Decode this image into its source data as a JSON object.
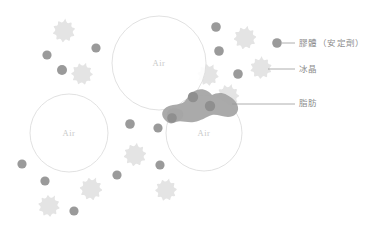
{
  "diagram": {
    "background": "#ffffff",
    "air_cells": [
      {
        "label": "Air",
        "cx": 159,
        "cy": 63,
        "r": 47
      },
      {
        "label": "Air",
        "cx": 69,
        "cy": 133,
        "r": 39
      },
      {
        "label": "Air",
        "cx": 204,
        "cy": 133,
        "r": 38
      }
    ],
    "air_cell_stroke": "#dedede",
    "air_label_color": "#c9c9c9",
    "colloid": {
      "name": "colloid-particle",
      "color": "#9a9a9a",
      "points": [
        {
          "cx": 62,
          "cy": 70,
          "r": 5.0
        },
        {
          "cx": 47,
          "cy": 55,
          "r": 4.6
        },
        {
          "cx": 96,
          "cy": 48,
          "r": 4.6
        },
        {
          "cx": 216,
          "cy": 27,
          "r": 4.8
        },
        {
          "cx": 219,
          "cy": 51,
          "r": 4.8
        },
        {
          "cx": 238,
          "cy": 74,
          "r": 4.8
        },
        {
          "cx": 130,
          "cy": 124,
          "r": 4.8
        },
        {
          "cx": 158,
          "cy": 128,
          "r": 4.6
        },
        {
          "cx": 22,
          "cy": 164,
          "r": 4.6
        },
        {
          "cx": 45,
          "cy": 181,
          "r": 4.6
        },
        {
          "cx": 117,
          "cy": 175,
          "r": 4.6
        },
        {
          "cx": 160,
          "cy": 165,
          "r": 4.6
        },
        {
          "cx": 74,
          "cy": 211,
          "r": 4.6
        }
      ]
    },
    "ice_crystal": {
      "name": "ice-crystal",
      "color": "#e4e4e4",
      "points": [
        {
          "cx": 64,
          "cy": 31,
          "r": 12.5,
          "spikes": 10,
          "rot": 6
        },
        {
          "cx": 82,
          "cy": 74,
          "r": 12.0,
          "spikes": 10,
          "rot": 20
        },
        {
          "cx": 245,
          "cy": 38,
          "r": 12.5,
          "spikes": 10,
          "rot": 12
        },
        {
          "cx": 208,
          "cy": 75,
          "r": 12.0,
          "spikes": 10,
          "rot": 28
        },
        {
          "cx": 261,
          "cy": 68,
          "r": 12.0,
          "spikes": 10,
          "rot": 3
        },
        {
          "cx": 228,
          "cy": 96,
          "r": 12.5,
          "spikes": 10,
          "rot": 17
        },
        {
          "cx": 196,
          "cy": 112,
          "r": 12.0,
          "spikes": 10,
          "rot": 33
        },
        {
          "cx": 135,
          "cy": 155,
          "r": 12.5,
          "spikes": 10,
          "rot": 9
        },
        {
          "cx": 91,
          "cy": 189,
          "r": 12.5,
          "spikes": 10,
          "rot": 24
        },
        {
          "cx": 166,
          "cy": 190,
          "r": 12.0,
          "spikes": 10,
          "rot": 15
        },
        {
          "cx": 49,
          "cy": 206,
          "r": 12.0,
          "spikes": 10,
          "rot": 30
        }
      ]
    },
    "fat": {
      "name": "fat-globule-cluster",
      "color": "#a5a5a5",
      "embedded_dots": [
        {
          "cx": 193,
          "cy": 97,
          "r": 5.2
        },
        {
          "cx": 210,
          "cy": 106,
          "r": 5.2
        },
        {
          "cx": 172,
          "cy": 118,
          "r": 4.8
        }
      ]
    }
  },
  "legend": {
    "items": [
      {
        "id": "colloid",
        "label": "膠體（安定劑）",
        "marker": "dot",
        "marker_color": "#9a9a9a",
        "text_x": 299,
        "text_y": 39,
        "marker_x": 277,
        "marker_y": 43,
        "line_x1": 282,
        "line_y1": 43,
        "line_x2": 295,
        "line_y2": 43
      },
      {
        "id": "ice-crystal",
        "label": "冰晶",
        "marker": "line",
        "marker_color": "#9a9a9a",
        "text_x": 299,
        "text_y": 65,
        "line_x1": 268,
        "line_y1": 69,
        "line_x2": 295,
        "line_y2": 69
      },
      {
        "id": "fat",
        "label": "脂肪",
        "marker": "line",
        "marker_color": "#9a9a9a",
        "text_x": 299,
        "text_y": 99,
        "line_x1": 232,
        "line_y1": 104,
        "line_x2": 295,
        "line_y2": 104
      }
    ],
    "line_color": "#9a9a9a",
    "text_color": "#8c8c8c"
  }
}
